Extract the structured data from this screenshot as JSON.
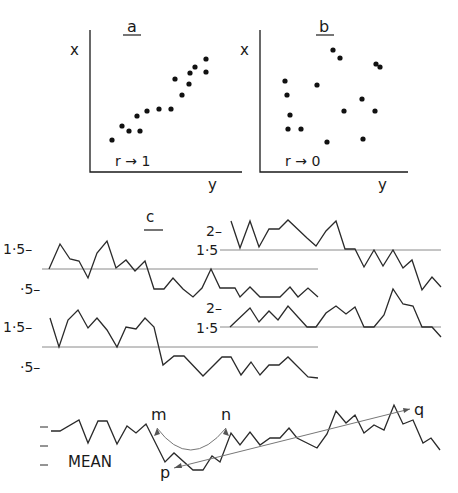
{
  "chart_data": [
    {
      "id": "a",
      "type": "scatter",
      "title": "a",
      "xlabel": "y",
      "ylabel": "x",
      "annotation": "r → 1",
      "axes_px": {
        "origin": [
          90,
          172
        ],
        "x_end": [
          242,
          172
        ],
        "y_top": [
          90,
          30
        ]
      },
      "points_px": [
        [
          112,
          140
        ],
        [
          122,
          126
        ],
        [
          129,
          131
        ],
        [
          137,
          116
        ],
        [
          140,
          131
        ],
        [
          147,
          111
        ],
        [
          159,
          109
        ],
        [
          171,
          109
        ],
        [
          175,
          79
        ],
        [
          182,
          95
        ],
        [
          189,
          84
        ],
        [
          190,
          73
        ],
        [
          195,
          67
        ],
        [
          206,
          59
        ],
        [
          206,
          72
        ]
      ]
    },
    {
      "id": "b",
      "type": "scatter",
      "title": "b",
      "xlabel": "y",
      "ylabel": "x",
      "annotation": "r → 0",
      "axes_px": {
        "origin": [
          260,
          172
        ],
        "x_end": [
          408,
          172
        ],
        "y_top": [
          260,
          30
        ]
      },
      "points_px": [
        [
          285,
          81
        ],
        [
          287,
          95
        ],
        [
          290,
          115
        ],
        [
          288,
          129
        ],
        [
          301,
          129
        ],
        [
          317,
          85
        ],
        [
          333,
          50
        ],
        [
          340,
          58
        ],
        [
          344,
          111
        ],
        [
          362,
          99
        ],
        [
          363,
          139
        ],
        [
          327,
          142
        ],
        [
          375,
          111
        ],
        [
          376,
          64
        ],
        [
          380,
          67
        ]
      ]
    },
    {
      "id": "c",
      "type": "line",
      "title": "c",
      "series": [
        {
          "name": "c1",
          "baseline_px": {
            "y": 269,
            "x1": 42,
            "x2": 318
          },
          "tick_labels": [
            {
              "text": "1·5–",
              "x": 3,
              "y": 253
            },
            {
              "text": "·5–",
              "x": 20,
              "y": 293
            }
          ],
          "points_px": [
            [
              49,
              269
            ],
            [
              60,
              244
            ],
            [
              70,
              259
            ],
            [
              79,
              261
            ],
            [
              88,
              278
            ],
            [
              97,
              253
            ],
            [
              107,
              241
            ],
            [
              116,
              268
            ],
            [
              126,
              260
            ],
            [
              135,
              271
            ],
            [
              145,
              261
            ],
            [
              154,
              289
            ],
            [
              164,
              289
            ],
            [
              173,
              278
            ],
            [
              183,
              289
            ],
            [
              193,
              297
            ],
            [
              202,
              288
            ],
            [
              211,
              269
            ],
            [
              220,
              288
            ],
            [
              235,
              288
            ],
            [
              240,
              297
            ],
            [
              250,
              287
            ],
            [
              260,
              297
            ],
            [
              280,
              297
            ],
            [
              290,
              287
            ],
            [
              298,
              297
            ],
            [
              308,
              288
            ],
            [
              318,
              297
            ]
          ]
        },
        {
          "name": "c2",
          "baseline_px": {
            "y": 250,
            "x1": 220,
            "x2": 441
          },
          "tick_labels": [
            {
              "text": "2–",
              "x": 208,
              "y": 235
            },
            {
              "text": "1·5",
              "x": 197,
              "y": 255
            }
          ],
          "points_px": [
            [
              231,
              221
            ],
            [
              240,
              248
            ],
            [
              250,
              221
            ],
            [
              259,
              247
            ],
            [
              269,
              229
            ],
            [
              279,
              229
            ],
            [
              288,
              220
            ],
            [
              307,
              238
            ],
            [
              316,
              246
            ],
            [
              326,
              231
            ],
            [
              336,
              221
            ],
            [
              345,
              249
            ],
            [
              355,
              249
            ],
            [
              364,
              267
            ],
            [
              374,
              250
            ],
            [
              383,
              266
            ],
            [
              393,
              250
            ],
            [
              403,
              268
            ],
            [
              412,
              260
            ],
            [
              422,
              290
            ],
            [
              432,
              277
            ],
            [
              441,
              287
            ]
          ]
        },
        {
          "name": "c3",
          "baseline_px": {
            "y": 347,
            "x1": 42,
            "x2": 318
          },
          "tick_labels": [
            {
              "text": "1·5–",
              "x": 3,
              "y": 331
            },
            {
              "text": "·5–",
              "x": 20,
              "y": 371
            }
          ],
          "points_px": [
            [
              50,
              318
            ],
            [
              59,
              347
            ],
            [
              68,
              320
            ],
            [
              78,
              310
            ],
            [
              88,
              328
            ],
            [
              97,
              318
            ],
            [
              107,
              330
            ],
            [
              117,
              347
            ],
            [
              126,
              327
            ],
            [
              136,
              329
            ],
            [
              145,
              318
            ],
            [
              154,
              327
            ],
            [
              163,
              365
            ],
            [
              174,
              356
            ],
            [
              184,
              356
            ],
            [
              203,
              376
            ],
            [
              222,
              357
            ],
            [
              231,
              357
            ],
            [
              241,
              375
            ],
            [
              251,
              362
            ],
            [
              260,
              375
            ],
            [
              269,
              365
            ],
            [
              279,
              365
            ],
            [
              288,
              357
            ],
            [
              308,
              377
            ],
            [
              318,
              378
            ]
          ]
        },
        {
          "name": "c4",
          "baseline_px": {
            "y": 327,
            "x1": 220,
            "x2": 441
          },
          "tick_labels": [
            {
              "text": "2–",
              "x": 208,
              "y": 313
            },
            {
              "text": "1·5",
              "x": 197,
              "y": 332
            }
          ],
          "points_px": [
            [
              230,
              327
            ],
            [
              250,
              308
            ],
            [
              259,
              322
            ],
            [
              269,
              311
            ],
            [
              278,
              320
            ],
            [
              288,
              306
            ],
            [
              307,
              327
            ],
            [
              316,
              327
            ],
            [
              326,
              313
            ],
            [
              336,
              306
            ],
            [
              346,
              314
            ],
            [
              355,
              307
            ],
            [
              364,
              327
            ],
            [
              374,
              327
            ],
            [
              384,
              315
            ],
            [
              393,
              289
            ],
            [
              403,
              304
            ],
            [
              413,
              306
            ],
            [
              422,
              327
            ],
            [
              432,
              327
            ],
            [
              441,
              337
            ]
          ]
        }
      ]
    },
    {
      "id": "mean",
      "type": "line",
      "label": "MEAN",
      "ticks_px": [
        427,
        446,
        465
      ],
      "points_px": [
        [
          51,
          431
        ],
        [
          60,
          431
        ],
        [
          79,
          420
        ],
        [
          88,
          443
        ],
        [
          98,
          421
        ],
        [
          107,
          421
        ],
        [
          117,
          444
        ],
        [
          127,
          426
        ],
        [
          136,
          433
        ],
        [
          146,
          424
        ],
        [
          165,
          462
        ],
        [
          174,
          453
        ],
        [
          193,
          470
        ],
        [
          203,
          470
        ],
        [
          212,
          456
        ],
        [
          220,
          462
        ],
        [
          231,
          433
        ],
        [
          240,
          445
        ],
        [
          250,
          432
        ],
        [
          260,
          445
        ],
        [
          270,
          438
        ],
        [
          280,
          438
        ],
        [
          289,
          428
        ],
        [
          297,
          438
        ],
        [
          317,
          448
        ],
        [
          327,
          434
        ],
        [
          336,
          411
        ],
        [
          346,
          423
        ],
        [
          355,
          415
        ],
        [
          364,
          433
        ],
        [
          374,
          425
        ],
        [
          384,
          430
        ],
        [
          394,
          405
        ],
        [
          403,
          424
        ],
        [
          413,
          420
        ],
        [
          423,
          443
        ],
        [
          431,
          438
        ],
        [
          440,
          450
        ]
      ],
      "annotations": [
        {
          "text": "m",
          "x": 152,
          "y": 420
        },
        {
          "text": "n",
          "x": 221,
          "y": 420
        },
        {
          "text": "p",
          "x": 160,
          "y": 478
        },
        {
          "text": "q",
          "x": 414,
          "y": 414
        }
      ],
      "arc_mn": {
        "from": [
          157,
          428
        ],
        "ctrl": [
          190,
          472
        ],
        "to": [
          226,
          428
        ]
      },
      "arrow_pq": {
        "from": [
          174,
          468
        ],
        "to": [
          410,
          409
        ]
      }
    }
  ],
  "labels": {
    "panel_a": "a",
    "panel_b": "b",
    "panel_c": "c",
    "a_x": "x",
    "a_y": "y",
    "a_r": "r → 1",
    "b_x": "x",
    "b_y": "y",
    "b_r": "r → 0",
    "mean": "MEAN",
    "m": "m",
    "n": "n",
    "p": "p",
    "q": "q",
    "c1_tick_hi": "1·5–",
    "c1_tick_lo": "·5–",
    "c2_tick_hi": "2–",
    "c2_tick_lo": "1·5",
    "c3_tick_hi": "1·5–",
    "c3_tick_lo": "·5–",
    "c4_tick_hi": "2–",
    "c4_tick_lo": "1·5"
  }
}
